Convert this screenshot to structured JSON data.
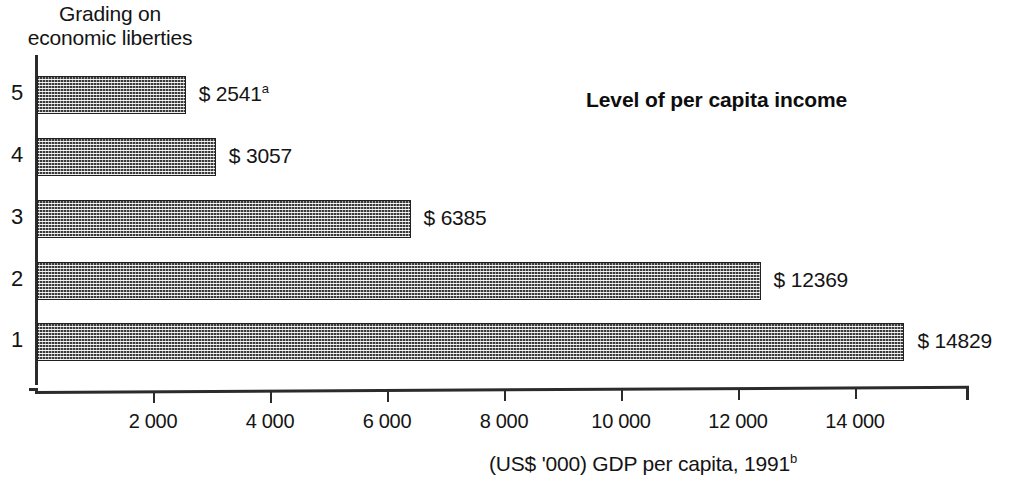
{
  "chart_data": {
    "type": "bar",
    "orientation": "horizontal",
    "title": "Level of per capita income",
    "xlabel": "(US$ '000) GDP per capita, 1991",
    "xlabel_superscript": "b",
    "ylabel": "Grading on\neconomic liberties",
    "categories": [
      "5",
      "4",
      "3",
      "2",
      "1"
    ],
    "values": [
      2541,
      3057,
      6385,
      12369,
      14829
    ],
    "value_labels": [
      "$ 2541",
      "$ 3057",
      "$ 6385",
      "$ 12369",
      "$ 14829"
    ],
    "value_label_superscripts": [
      "a",
      "",
      "",
      "",
      ""
    ],
    "xlim": [
      0,
      15960
    ],
    "xticks": [
      2000,
      4000,
      6000,
      8000,
      10000,
      12000,
      14000
    ],
    "xtick_labels": [
      "2 000",
      "4 000",
      "6 000",
      "8 000",
      "10 000",
      "12 000",
      "14 000"
    ],
    "grid": false,
    "legend": false,
    "bar_fill": "#3a3a3a",
    "axis_color": "#2b2b2b",
    "background": "#ffffff"
  },
  "bars": [
    {
      "category": "5",
      "label": "$ 2541",
      "sup": "a",
      "value": 2541
    },
    {
      "category": "4",
      "label": "$ 3057",
      "sup": "",
      "value": 3057
    },
    {
      "category": "3",
      "label": "$ 6385",
      "sup": "",
      "value": 6385
    },
    {
      "category": "2",
      "label": "$ 12369",
      "sup": "",
      "value": 12369
    },
    {
      "category": "1",
      "label": "$ 14829",
      "sup": "",
      "value": 14829
    }
  ],
  "axis": {
    "y_title": "Grading on\neconomic liberties",
    "x_title": "(US$ '000) GDP per capita, 1991",
    "x_title_sup": "b",
    "xtick_labels": [
      "2 000",
      "4 000",
      "6 000",
      "8 000",
      "10 000",
      "12 000",
      "14 000"
    ]
  },
  "title": "Level of per capita income"
}
